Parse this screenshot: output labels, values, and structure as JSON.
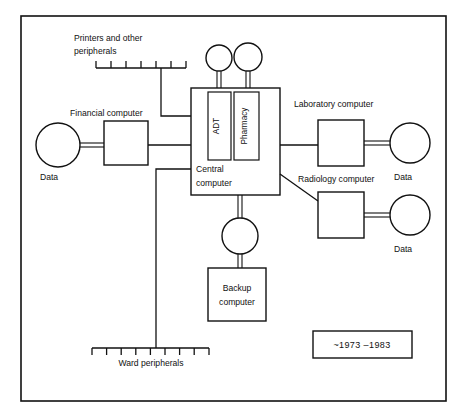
{
  "figure": {
    "era_label": "~1973 –1983"
  },
  "nodes": {
    "central": {
      "label_line1": "Central",
      "label_line2": "computer"
    },
    "adt": {
      "label": "ADT"
    },
    "pharmacy": {
      "label": "Pharmacy"
    },
    "financial": {
      "label": "Financial computer"
    },
    "laboratory": {
      "label": "Laboratory computer"
    },
    "radiology": {
      "label": "Radiology computer"
    },
    "backup": {
      "label_line1": "Backup",
      "label_line2": "computer"
    }
  },
  "storage": {
    "financial_data": "Data",
    "laboratory_data": "Data",
    "radiology_data": "Data"
  },
  "peripherals": {
    "printers_line1": "Printers and other",
    "printers_line2": "peripherals",
    "printers_tick_count": 7,
    "ward_label": "Ward peripherals",
    "ward_tick_count": 9
  },
  "style": {
    "ink": "#111111",
    "paper": "#ffffff"
  }
}
